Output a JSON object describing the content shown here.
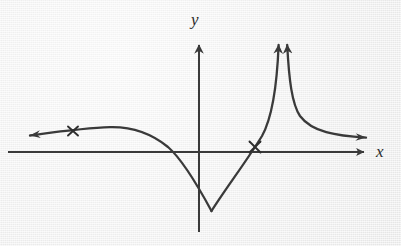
{
  "figure": {
    "kind": "math-graph",
    "width": 401,
    "height": 246,
    "background_color": "#efefef",
    "ink_color": "#3a3a3a"
  },
  "axes": {
    "x_label": "x",
    "y_label": "y",
    "x_axis": {
      "y_pixel": 152,
      "start_x": 8,
      "end_x": 368,
      "arrow": "right"
    },
    "y_axis": {
      "x_pixel": 199,
      "start_y": 232,
      "end_y": 40,
      "arrow": "up"
    }
  },
  "markers": [
    {
      "name": "x-marker-left-branch",
      "x": 73,
      "y": 131,
      "symbol": "×"
    },
    {
      "name": "x-marker-rising-branch",
      "x": 255,
      "y": 147,
      "symbol": "×"
    }
  ],
  "chart_data": {
    "type": "line",
    "title": "",
    "xlabel": "x",
    "ylabel": "y",
    "grid": false,
    "legend": null,
    "features": {
      "left_tail_arrow": {
        "x": 26,
        "y": 136,
        "direction": "left"
      },
      "local_maximum": {
        "x": 110,
        "y": 127
      },
      "x_intercept_left": {
        "x": 172,
        "y": 152
      },
      "cusp_minimum": {
        "x": 212,
        "y": 212
      },
      "x_intercept_right": {
        "x": 249,
        "y": 152
      },
      "vertical_asymptote_x": 283,
      "asymptote_arrow_left": {
        "x": 279,
        "y": 33,
        "direction": "up"
      },
      "asymptote_arrow_right": {
        "x": 287,
        "y": 33,
        "direction": "up"
      },
      "right_tail_arrow": {
        "x": 370,
        "y": 138,
        "direction": "right-down"
      }
    },
    "branches": [
      {
        "name": "left-branch",
        "path": "M 30 135.5 C 60 131.5, 86 127.8, 110 127.2 C 134 126.6, 152 134, 168 147 C 183 160, 198 186, 211.5 211"
      },
      {
        "name": "rising-branch-to-asymptote",
        "path": "M 211.5 211 C 226 188, 246 162, 262 136 C 272 118, 277 86, 278.6 45"
      },
      {
        "name": "right-branch-from-asymptote",
        "path": "M 287.2 45 C 289 80, 292 104, 300 116 C 312 132, 336 136, 366 137.6"
      }
    ]
  }
}
